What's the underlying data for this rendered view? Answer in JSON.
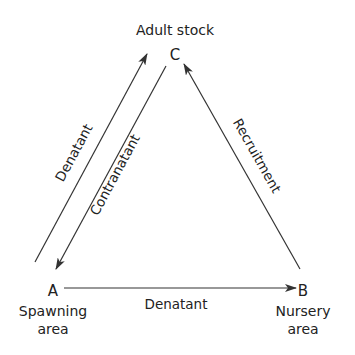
{
  "diagram": {
    "type": "life-cycle-triangle",
    "nodes": {
      "C": {
        "letter": "C",
        "label": "Adult stock"
      },
      "A": {
        "letter": "A",
        "label_line1": "Spawning",
        "label_line2": "area"
      },
      "B": {
        "letter": "B",
        "label_line1": "Nursery",
        "label_line2": "area"
      }
    },
    "edges": [
      {
        "from": "A",
        "to": "C",
        "label": "Denatant"
      },
      {
        "from": "C",
        "to": "A",
        "label": "Contranatant"
      },
      {
        "from": "B",
        "to": "C",
        "label": "Recruitment"
      },
      {
        "from": "A",
        "to": "B",
        "label": "Denatant"
      }
    ],
    "colors": {
      "line": "#333333",
      "text": "#222222",
      "background": "#ffffff"
    }
  }
}
